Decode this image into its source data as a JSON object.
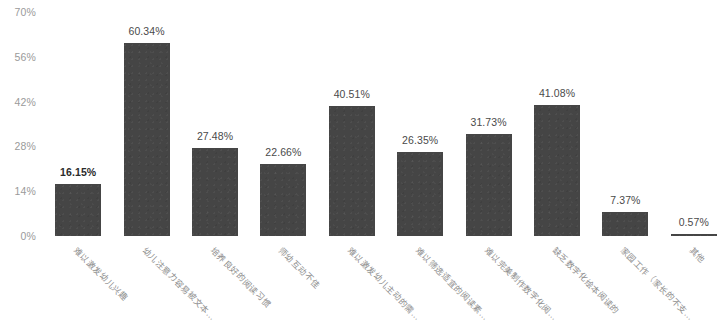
{
  "chart_data": {
    "type": "bar",
    "title": "",
    "xlabel": "",
    "ylabel": "",
    "ylim": [
      0,
      70
    ],
    "grid": false,
    "legend": "none",
    "y_ticks": [
      "0%",
      "14%",
      "28%",
      "42%",
      "56%",
      "70%"
    ],
    "y_tick_values": [
      0,
      14,
      28,
      42,
      56,
      70
    ],
    "categories": [
      "难以激发幼儿兴趣",
      "幼儿注意力容易被文本…",
      "培养良好的阅读习惯",
      "师幼互动不佳",
      "难以激发幼儿主动的需…",
      "难以筛选适宜的阅读素…",
      "难以完美制作数字化阅…",
      "缺乏数字化绘本阅读的",
      "家园工作（家长的不支…",
      "其他"
    ],
    "values": [
      16.15,
      60.34,
      27.48,
      22.66,
      40.51,
      26.35,
      31.73,
      41.08,
      7.37,
      0.57
    ],
    "value_labels": [
      "16.15%",
      "60.34%",
      "27.48%",
      "22.66%",
      "40.51%",
      "26.35%",
      "31.73%",
      "41.08%",
      "7.37%",
      "0.57%"
    ],
    "bar_color": "#454545",
    "axis_text_color": "#9a9a9a",
    "label_text_color": "#4a4a4a"
  }
}
